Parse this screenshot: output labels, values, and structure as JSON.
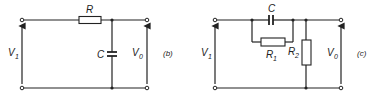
{
  "circuits": [
    {
      "id": "b",
      "tag": "(b)",
      "input_voltage": {
        "symbol": "V",
        "subscript": "1"
      },
      "output_voltage": {
        "symbol": "V",
        "subscript": "0"
      },
      "components": [
        {
          "type": "resistor",
          "label": "R",
          "subscript": "",
          "placement": "series"
        },
        {
          "type": "capacitor",
          "label": "C",
          "subscript": "",
          "placement": "shunt"
        }
      ]
    },
    {
      "id": "c",
      "tag": "(c)",
      "input_voltage": {
        "symbol": "V",
        "subscript": "1"
      },
      "output_voltage": {
        "symbol": "V",
        "subscript": "0"
      },
      "components": [
        {
          "type": "capacitor",
          "label": "C",
          "subscript": "",
          "placement": "series, parallel with R1"
        },
        {
          "type": "resistor",
          "label": "R",
          "subscript": "1",
          "placement": "series, parallel with C"
        },
        {
          "type": "resistor",
          "label": "R",
          "subscript": "2",
          "placement": "shunt"
        }
      ]
    }
  ]
}
